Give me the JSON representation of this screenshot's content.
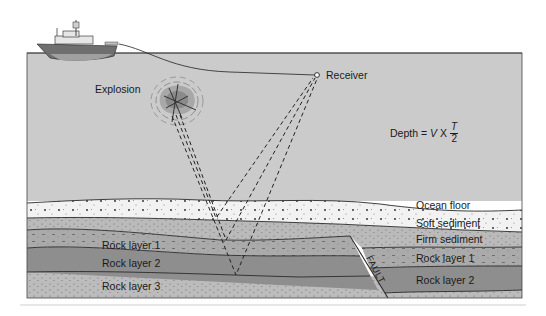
{
  "diagram": {
    "labels": {
      "explosion": "Explosion",
      "receiver": "Receiver",
      "ocean_floor": "Ocean floor",
      "soft_sediment": "Soft sediment",
      "firm_sediment": "Firm sediment",
      "rock_layer_1_left": "Rock layer 1",
      "rock_layer_2_left": "Rock layer 2",
      "rock_layer_3_left": "Rock layer 3",
      "rock_layer_1_right": "Rock layer 1",
      "rock_layer_2_right": "Rock layer 2",
      "fault": "FAULT"
    },
    "formula": {
      "lhs": "Depth =",
      "v": "V",
      "times": "X",
      "numerator": "T",
      "denominator": "2"
    },
    "colors": {
      "water": "#c9c9c9",
      "soft_sediment": "#f2f2f2",
      "firm_sediment": "#b8b8b8",
      "rock_layer_1": "#a9a9a9",
      "rock_layer_2": "#8e8e8e",
      "rock_layer_3": "#bcbcbc",
      "lines": "#2a2a2a"
    }
  }
}
